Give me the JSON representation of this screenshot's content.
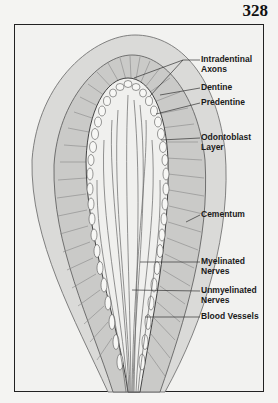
{
  "page": {
    "number": "328"
  },
  "figure": {
    "labels": [
      {
        "id": "intradentinal-axons",
        "line1": "Intradentinal",
        "line2": "Axons"
      },
      {
        "id": "dentine",
        "line1": "Dentine",
        "line2": ""
      },
      {
        "id": "predentine",
        "line1": "Predentine",
        "line2": ""
      },
      {
        "id": "odontoblast-layer",
        "line1": "Odontoblast",
        "line2": "Layer"
      },
      {
        "id": "cementum",
        "line1": "Cementum",
        "line2": ""
      },
      {
        "id": "myelinated-nerves",
        "line1": "Myelinated",
        "line2": "Nerves"
      },
      {
        "id": "unmyelinated-nerves",
        "line1": "Unmyelinated",
        "line2": "Nerves"
      },
      {
        "id": "blood-vessels",
        "line1": "Blood Vessels",
        "line2": ""
      }
    ],
    "colors": {
      "cementum": "#d9d9d7",
      "dentine": "#c9c9c7",
      "pulp": "#efefed",
      "line": "#555555"
    }
  }
}
